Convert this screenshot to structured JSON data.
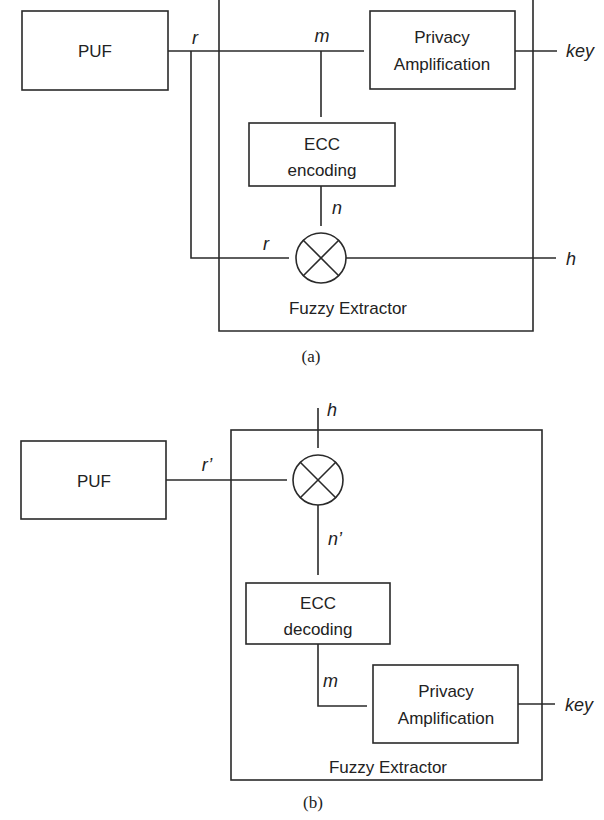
{
  "colors": {
    "stroke": "#2a2a2a",
    "text": "#222222",
    "background": "#ffffff"
  },
  "diagram_a": {
    "caption": "(a)",
    "container_label": "Fuzzy Extractor",
    "puf_label": "PUF",
    "privacy_amp": {
      "line1": "Privacy",
      "line2": "Amplification"
    },
    "ecc": {
      "line1": "ECC",
      "line2": "encoding"
    },
    "signals": {
      "r_top": "r",
      "m": "m",
      "n": "n",
      "r_bottom": "r",
      "key": "key",
      "h": "h"
    },
    "xor_icon": "xor-circle-icon"
  },
  "diagram_b": {
    "caption": "(b)",
    "container_label": "Fuzzy Extractor",
    "puf_label": "PUF",
    "privacy_amp": {
      "line1": "Privacy",
      "line2": "Amplification"
    },
    "ecc": {
      "line1": "ECC",
      "line2": "decoding"
    },
    "signals": {
      "r_prime": "r’",
      "h": "h",
      "n_prime": "n’",
      "m": "m",
      "key": "key"
    },
    "xor_icon": "xor-circle-icon"
  }
}
